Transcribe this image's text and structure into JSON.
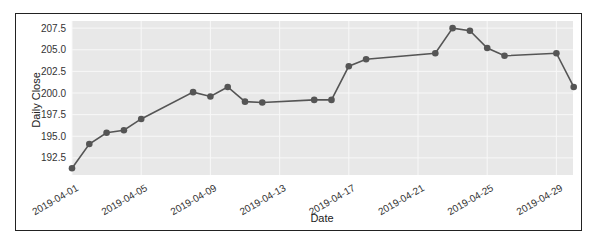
{
  "chart_data": {
    "type": "line",
    "title": "",
    "xlabel": "Date",
    "ylabel": "Daily Close",
    "ylim": [
      191.0,
      208.5
    ],
    "y_ticks": [
      192.5,
      195.0,
      197.5,
      200.0,
      202.5,
      205.0,
      207.5
    ],
    "x_ticks": [
      "2019-04-01",
      "2019-04-05",
      "2019-04-09",
      "2019-04-13",
      "2019-04-17",
      "2019-04-21",
      "2019-04-25",
      "2019-04-29"
    ],
    "grid": true,
    "legend": null,
    "series": [
      {
        "name": "Daily Close",
        "color": "#555555",
        "marker": "circle",
        "x": [
          "2019-04-01",
          "2019-04-02",
          "2019-04-03",
          "2019-04-04",
          "2019-04-05",
          "2019-04-08",
          "2019-04-09",
          "2019-04-10",
          "2019-04-11",
          "2019-04-12",
          "2019-04-15",
          "2019-04-16",
          "2019-04-17",
          "2019-04-18",
          "2019-04-22",
          "2019-04-23",
          "2019-04-24",
          "2019-04-25",
          "2019-04-26",
          "2019-04-29",
          "2019-04-30"
        ],
        "values": [
          191.3,
          194.1,
          195.4,
          195.7,
          197.0,
          200.1,
          199.6,
          200.7,
          199.0,
          198.9,
          199.2,
          199.2,
          203.1,
          203.9,
          204.6,
          207.5,
          207.2,
          205.2,
          204.3,
          204.6,
          200.7
        ]
      }
    ]
  },
  "labels": {
    "xlabel": "Date",
    "ylabel": "Daily Close"
  },
  "colors": {
    "plot_bg": "#e8e8e8",
    "grid": "#f8f8f8",
    "line": "#555555",
    "frame": "#222222"
  }
}
